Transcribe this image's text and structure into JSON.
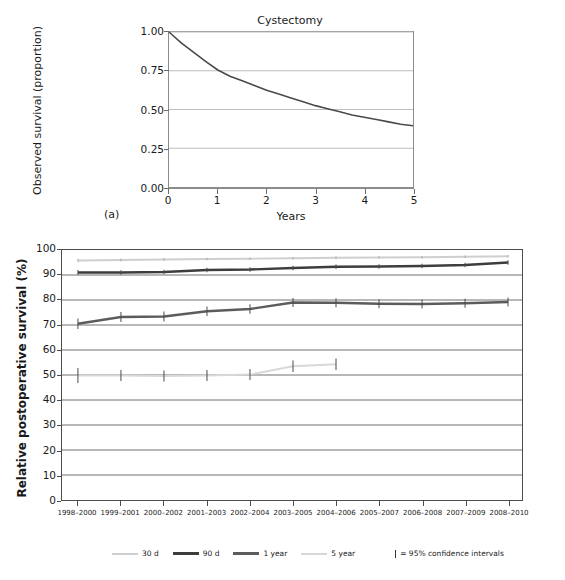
{
  "figure": {
    "panel_a_letter": "(a)",
    "panel_b_letter": "(b)"
  },
  "chart_data": [
    {
      "id": "panel_a",
      "type": "line",
      "title": "Cystectomy",
      "xlabel": "Years",
      "ylabel": "Observed survival (proportion)",
      "xlim": [
        0,
        5
      ],
      "ylim": [
        0.0,
        1.0
      ],
      "xticks": [
        "0",
        "1",
        "2",
        "3",
        "4",
        "5"
      ],
      "yticks": [
        "0.00",
        "0.25",
        "0.50",
        "0.75",
        "1.00"
      ],
      "grid": true,
      "legend": "none",
      "series": [
        {
          "name": "Observed survival",
          "color": "#4a4a4a",
          "x": [
            0,
            0.25,
            0.5,
            0.75,
            1.0,
            1.25,
            1.5,
            1.75,
            2.0,
            2.25,
            2.5,
            2.75,
            3.0,
            3.25,
            3.5,
            3.75,
            4.0,
            4.25,
            4.5,
            4.75,
            5.0
          ],
          "values": [
            1.0,
            0.93,
            0.87,
            0.81,
            0.755,
            0.715,
            0.685,
            0.655,
            0.625,
            0.6,
            0.575,
            0.55,
            0.525,
            0.505,
            0.485,
            0.465,
            0.45,
            0.435,
            0.42,
            0.405,
            0.395
          ]
        }
      ]
    },
    {
      "id": "panel_b",
      "type": "line",
      "title": "",
      "xlabel": "Operation year",
      "ylabel": "Relative postoperative survival (%)",
      "ylim": [
        0,
        100
      ],
      "ytick_step": 10,
      "grid": true,
      "legend_position": "bottom",
      "yticks": [
        "100",
        "90",
        "80",
        "70",
        "60",
        "50",
        "40",
        "30",
        "20",
        "10",
        "0"
      ],
      "categories": [
        "1998–2000",
        "1999–2001",
        "2000–2002",
        "2001–2003",
        "2002–2004",
        "2003–2005",
        "2004–2006",
        "2005–2007",
        "2006–2008",
        "2007–2009",
        "2008–2010"
      ],
      "annotation": "| = 95% confidence intervals",
      "series": [
        {
          "name": "30 d",
          "color": "#cfcfcf",
          "values": [
            95.8,
            96.0,
            96.2,
            96.4,
            96.5,
            96.7,
            96.9,
            97.0,
            97.1,
            97.3,
            97.5
          ],
          "ci_low": [
            95.1,
            95.4,
            95.6,
            95.9,
            96.0,
            96.2,
            96.4,
            96.5,
            96.6,
            96.8,
            97.0
          ],
          "ci_high": [
            96.5,
            96.6,
            96.8,
            96.9,
            97.0,
            97.2,
            97.4,
            97.5,
            97.6,
            97.8,
            98.0
          ]
        },
        {
          "name": "90 d",
          "color": "#3d3d3d",
          "values": [
            91.0,
            91.0,
            91.2,
            92.0,
            92.2,
            92.8,
            93.3,
            93.4,
            93.6,
            94.0,
            95.0
          ],
          "ci_low": [
            90.0,
            90.1,
            90.3,
            91.1,
            91.3,
            91.9,
            92.4,
            92.5,
            92.7,
            93.1,
            94.1
          ],
          "ci_high": [
            92.0,
            91.9,
            92.1,
            92.9,
            93.1,
            93.7,
            94.2,
            94.3,
            94.5,
            94.9,
            95.9
          ]
        },
        {
          "name": "1 year",
          "color": "#5c5c5c",
          "values": [
            70.5,
            73.2,
            73.4,
            75.5,
            76.4,
            79.0,
            78.9,
            78.5,
            78.4,
            78.7,
            79.2
          ],
          "ci_low": [
            68.4,
            71.2,
            71.4,
            73.6,
            74.5,
            77.2,
            77.1,
            76.7,
            76.6,
            76.9,
            77.4
          ],
          "ci_high": [
            72.6,
            75.2,
            75.4,
            77.4,
            78.3,
            80.8,
            80.7,
            80.3,
            80.2,
            80.5,
            81.0
          ]
        },
        {
          "name": "5 year",
          "color": "#d8d8d8",
          "values": [
            49.8,
            49.8,
            49.6,
            49.8,
            50.2,
            53.5,
            54.3,
            null,
            null,
            null,
            null
          ],
          "ci_low": [
            46.8,
            47.6,
            47.4,
            47.6,
            48.0,
            51.2,
            52.0,
            null,
            null,
            null,
            null
          ],
          "ci_high": [
            52.8,
            52.0,
            51.8,
            52.0,
            52.4,
            55.8,
            56.6,
            null,
            null,
            null,
            null
          ]
        }
      ]
    }
  ],
  "legend": {
    "items": [
      {
        "label": "30 d",
        "color": "#cfcfcf",
        "thickness": 2
      },
      {
        "label": "90 d",
        "color": "#3d3d3d",
        "thickness": 3
      },
      {
        "label": "1 year",
        "color": "#5c5c5c",
        "thickness": 3
      },
      {
        "label": "5 year",
        "color": "#d8d8d8",
        "thickness": 2
      }
    ],
    "ci_note": "= 95% confidence intervals"
  }
}
